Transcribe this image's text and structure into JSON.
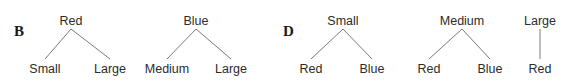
{
  "figure": {
    "type": "tree-diagram",
    "width": 570,
    "height": 84,
    "background_color": "#ffffff",
    "text_color": "#2b2b2b",
    "edge_color": "#7a7a7a"
  },
  "panels": [
    {
      "id": "panel-b",
      "label": "B",
      "label_x": 14,
      "label_y": 24,
      "trees": [
        {
          "id": "tree-b-red",
          "root": {
            "label": "Red",
            "x": 71,
            "y": 15
          },
          "leaves": [
            {
              "label": "Small",
              "x": 45,
              "y": 63
            },
            {
              "label": "Large",
              "x": 110,
              "y": 63
            }
          ]
        },
        {
          "id": "tree-b-blue",
          "root": {
            "label": "Blue",
            "x": 196,
            "y": 15
          },
          "leaves": [
            {
              "label": "Medium",
              "x": 167,
              "y": 63
            },
            {
              "label": "Large",
              "x": 231,
              "y": 63
            }
          ]
        }
      ]
    },
    {
      "id": "panel-d",
      "label": "D",
      "label_x": 283,
      "label_y": 24,
      "trees": [
        {
          "id": "tree-d-small",
          "root": {
            "label": "Small",
            "x": 343,
            "y": 15
          },
          "leaves": [
            {
              "label": "Red",
              "x": 311,
              "y": 63
            },
            {
              "label": "Blue",
              "x": 372,
              "y": 63
            }
          ]
        },
        {
          "id": "tree-d-medium",
          "root": {
            "label": "Medium",
            "x": 462,
            "y": 15
          },
          "leaves": [
            {
              "label": "Red",
              "x": 429,
              "y": 63
            },
            {
              "label": "Blue",
              "x": 490,
              "y": 63
            }
          ]
        },
        {
          "id": "tree-d-large",
          "root": {
            "label": "Large",
            "x": 540,
            "y": 15
          },
          "leaves": [
            {
              "label": "Red",
              "x": 540,
              "y": 63
            }
          ]
        }
      ]
    }
  ]
}
